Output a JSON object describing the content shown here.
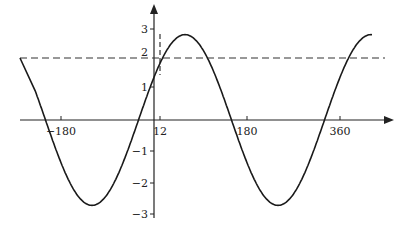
{
  "chart_data": {
    "type": "line",
    "title": "",
    "xlabel": "",
    "ylabel": "",
    "function": "y = 2.8 sin(x + 30°)",
    "amplitude": 2.8,
    "phase_shift_deg": 30,
    "x_range": [
      -255,
      410
    ],
    "ylim": [
      -3,
      3
    ],
    "x_ticks": [
      {
        "value": -180,
        "label": "−180"
      },
      {
        "value": 12,
        "label": "12"
      },
      {
        "value": 180,
        "label": "180"
      },
      {
        "value": 360,
        "label": "360"
      }
    ],
    "y_ticks": [
      {
        "value": 3,
        "label": "3"
      },
      {
        "value": 2,
        "label": "2"
      },
      {
        "value": 1,
        "label": "1"
      },
      {
        "value": -1,
        "label": "−1"
      },
      {
        "value": -2,
        "label": "−2"
      },
      {
        "value": -3,
        "label": "−3"
      }
    ],
    "reference_lines": [
      {
        "orientation": "horizontal",
        "value": 2,
        "style": "dashed"
      },
      {
        "orientation": "vertical",
        "value": 12,
        "style": "dashed"
      }
    ],
    "grid": false,
    "legend": null,
    "colors": {
      "curve": "#1a1a1a",
      "axes": "#222222",
      "dashed": "#333333"
    }
  }
}
